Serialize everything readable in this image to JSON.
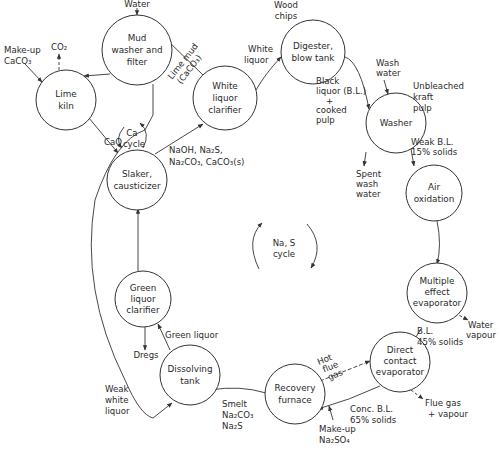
{
  "nodes": {
    "mud_washer": {
      "lines": [
        "Mud",
        "washer and",
        "filter"
      ]
    },
    "lime_kiln": {
      "lines": [
        "Lime",
        "kiln"
      ]
    },
    "white_liquor_clarifier": {
      "lines": [
        "White",
        "liquor",
        "clarifier"
      ]
    },
    "digester": {
      "lines": [
        "Digester,",
        "blow tank"
      ]
    },
    "washer": {
      "lines": [
        "Washer"
      ]
    },
    "air_oxidation": {
      "lines": [
        "Air",
        "oxidation"
      ]
    },
    "slaker": {
      "lines": [
        "Slaker,",
        "causticizer"
      ]
    },
    "green_liquor_clarifier": {
      "lines": [
        "Green",
        "liquor",
        "clarifier"
      ]
    },
    "multiple_effect_evaporator": {
      "lines": [
        "Multiple",
        "effect",
        "evaporator"
      ]
    },
    "dissolving_tank": {
      "lines": [
        "Dissolving",
        "tank"
      ]
    },
    "recovery_furnace": {
      "lines": [
        "Recovery",
        "furnace"
      ]
    },
    "direct_contact_evaporator": {
      "lines": [
        "Direct",
        "contact",
        "evaporator"
      ]
    }
  },
  "labels": {
    "water": "Water",
    "makeup_caco3": [
      "Make-up",
      "CaCO₃"
    ],
    "co2": "CO₂",
    "lime_mud": [
      "Lime mud",
      "(CaCO₃)"
    ],
    "white_liquor": [
      "White",
      "liquor"
    ],
    "wood_chips": [
      "Wood",
      "chips"
    ],
    "black_liquor": [
      "Black",
      "liquor (B.L.)",
      "+",
      "cooked",
      "pulp"
    ],
    "wash_water": [
      "Wash",
      "water"
    ],
    "unbleached_pulp": [
      "Unbleached",
      "kraft",
      "pulp"
    ],
    "weak_bl": [
      "Weak B.L.",
      "15% solids"
    ],
    "spent_wash": [
      "Spent",
      "wash",
      "water"
    ],
    "ca_cycle": [
      "Ca",
      "cycle"
    ],
    "cao": "CaO",
    "slaker_out": [
      "NaOH, Na₂S,",
      "Na₂CO₃, CaCO₃(s)"
    ],
    "na_s_cycle": [
      "Na, S",
      "cycle"
    ],
    "water_vapour": [
      "Water",
      "vapour"
    ],
    "bl_45": [
      "B.L.",
      "45% solids"
    ],
    "green_liquor": "Green liquor",
    "dregs": "Dregs",
    "hot_flue_gas": [
      "Hot",
      "flue",
      "gas"
    ],
    "flue_gas_vapour": [
      "Flue gas",
      "+ vapour"
    ],
    "conc_bl": [
      "Conc. B.L.",
      "65% solids"
    ],
    "makeup_na2so4": [
      "Make-up",
      "Na₂SO₄"
    ],
    "smelt": [
      "Smelt",
      "Na₂CO₃",
      "Na₂S"
    ],
    "weak_white_liquor": [
      "Weak",
      "white",
      "liquor"
    ]
  }
}
